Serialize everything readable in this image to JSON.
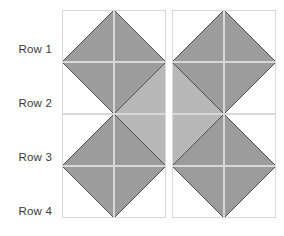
{
  "figure": {
    "type": "triangle-grid",
    "rows": 4,
    "columns": 4,
    "row_labels": [
      {
        "label": "Row 1"
      },
      {
        "label": "Row 2"
      },
      {
        "label": "Row 3"
      },
      {
        "label": "Row 4"
      }
    ],
    "colors": {
      "background": "#ffffff",
      "shade_dark": "#9c9c9c",
      "shade_light": "#b8b8b8",
      "cell_border": "#d8d8d8",
      "diagonal_line": "#4a4a4a",
      "label_text": "#3a3a3a"
    },
    "geometry": {
      "grid_left": 62,
      "grid_top": 10,
      "cell_size": 52,
      "column_pair_gap": 6,
      "row_gap": 2
    },
    "cells": [
      {
        "row": 1,
        "col": 1,
        "name": "cell-r1c1",
        "description": "shaded triangle lower-left to upper-right, white upper-left",
        "shapes": [
          {
            "points": "0,52 52,52 52,0",
            "fill": "#9c9c9c"
          }
        ],
        "diagonal": "0,52 52,0"
      },
      {
        "row": 1,
        "col": 2,
        "name": "cell-r1c2",
        "description": "shaded triangle lower-right to upper-left, white upper-right",
        "shapes": [
          {
            "points": "0,0 0,52 52,52",
            "fill": "#9c9c9c"
          }
        ],
        "diagonal": "0,0 52,52"
      },
      {
        "row": 1,
        "col": 3,
        "name": "cell-r1c3",
        "description": "shaded triangle lower-left to upper-right, white upper-left",
        "shapes": [
          {
            "points": "0,52 52,52 52,0",
            "fill": "#9c9c9c"
          }
        ],
        "diagonal": "0,52 52,0"
      },
      {
        "row": 1,
        "col": 4,
        "name": "cell-r1c4",
        "description": "shaded triangle lower-right to upper-left, white upper-right",
        "shapes": [
          {
            "points": "0,0 0,52 52,52",
            "fill": "#9c9c9c"
          }
        ],
        "diagonal": "0,0 52,52"
      },
      {
        "row": 2,
        "col": 1,
        "name": "cell-r2c1",
        "description": "shaded triangle upper-right, white lower-left",
        "shapes": [
          {
            "points": "0,0 52,0 52,52",
            "fill": "#9c9c9c"
          }
        ],
        "diagonal": "0,0 52,52"
      },
      {
        "row": 2,
        "col": 2,
        "name": "cell-r2c2",
        "description": "fully shaded, split bottom-left to top-right; upper-left darker",
        "shapes": [
          {
            "points": "0,0 52,0 0,52",
            "fill": "#9c9c9c"
          },
          {
            "points": "52,0 52,52 0,52",
            "fill": "#b8b8b8"
          }
        ],
        "diagonal": "0,52 52,0"
      },
      {
        "row": 2,
        "col": 3,
        "name": "cell-r2c3",
        "description": "fully shaded, split top-left to bottom-right; upper-right darker",
        "shapes": [
          {
            "points": "0,0 52,0 52,52",
            "fill": "#9c9c9c"
          },
          {
            "points": "0,0 52,52 0,52",
            "fill": "#b8b8b8"
          }
        ],
        "diagonal": "0,0 52,52"
      },
      {
        "row": 2,
        "col": 4,
        "name": "cell-r2c4",
        "description": "shaded triangle upper-left, white lower-right",
        "shapes": [
          {
            "points": "0,0 52,0 0,52",
            "fill": "#9c9c9c"
          }
        ],
        "diagonal": "52,0 0,52"
      },
      {
        "row": 3,
        "col": 1,
        "name": "cell-r3c1",
        "description": "shaded triangle lower-right, white upper-left",
        "shapes": [
          {
            "points": "0,52 52,52 52,0",
            "fill": "#9c9c9c"
          }
        ],
        "diagonal": "0,52 52,0"
      },
      {
        "row": 3,
        "col": 2,
        "name": "cell-r3c2",
        "description": "fully shaded, split top-left to bottom-right; lower-left darker",
        "shapes": [
          {
            "points": "0,0 52,52 0,52",
            "fill": "#9c9c9c"
          },
          {
            "points": "0,0 52,0 52,52",
            "fill": "#b8b8b8"
          }
        ],
        "diagonal": "0,0 52,52"
      },
      {
        "row": 3,
        "col": 3,
        "name": "cell-r3c3",
        "description": "fully shaded, split bottom-left to top-right; lower-right darker",
        "shapes": [
          {
            "points": "52,0 52,52 0,52",
            "fill": "#9c9c9c"
          },
          {
            "points": "0,0 52,0 0,52",
            "fill": "#b8b8b8"
          }
        ],
        "diagonal": "0,52 52,0"
      },
      {
        "row": 3,
        "col": 4,
        "name": "cell-r3c4",
        "description": "shaded triangle lower-left, white upper-right",
        "shapes": [
          {
            "points": "0,0 0,52 52,52",
            "fill": "#9c9c9c"
          }
        ],
        "diagonal": "0,0 52,52"
      },
      {
        "row": 4,
        "col": 1,
        "name": "cell-r4c1",
        "description": "shaded triangle upper-left to lower-right, white lower-left",
        "shapes": [
          {
            "points": "0,0 52,0 52,52",
            "fill": "#9c9c9c"
          }
        ],
        "diagonal": "0,0 52,52"
      },
      {
        "row": 4,
        "col": 2,
        "name": "cell-r4c2",
        "description": "shaded triangle upper-right to lower-left, white lower-right",
        "shapes": [
          {
            "points": "0,0 52,0 0,52",
            "fill": "#9c9c9c"
          }
        ],
        "diagonal": "52,0 0,52"
      },
      {
        "row": 4,
        "col": 3,
        "name": "cell-r4c3",
        "description": "shaded triangle upper-left to lower-right, white lower-left",
        "shapes": [
          {
            "points": "0,0 52,0 52,52",
            "fill": "#9c9c9c"
          }
        ],
        "diagonal": "0,0 52,52"
      },
      {
        "row": 4,
        "col": 4,
        "name": "cell-r4c4",
        "description": "shaded triangle upper-right to lower-left, white lower-right",
        "shapes": [
          {
            "points": "0,0 52,0 0,52",
            "fill": "#9c9c9c"
          }
        ],
        "diagonal": "52,0 0,52"
      }
    ]
  }
}
